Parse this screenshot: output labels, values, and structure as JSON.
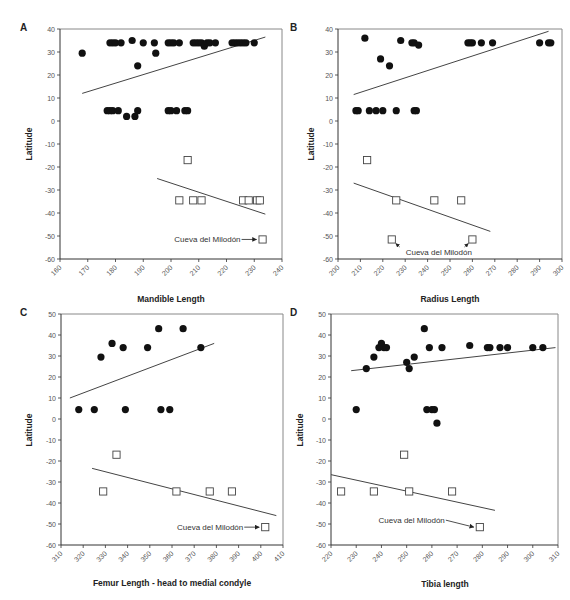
{
  "chart_data": [
    {
      "panel": "A",
      "type": "scatter",
      "xlabel": "Mandible Length",
      "ylabel": "Latitude",
      "xlim": [
        160,
        240
      ],
      "ylim": [
        -60,
        40
      ],
      "xticks": [
        160,
        170,
        180,
        190,
        200,
        210,
        220,
        230,
        240
      ],
      "yticks": [
        40,
        30,
        20,
        10,
        0,
        -10,
        -20,
        -30,
        -40,
        -50,
        -60
      ],
      "series": [
        {
          "name": "North (filled circles)",
          "marker": "circle",
          "points": [
            [
              168,
              29.5
            ],
            [
              178,
              34
            ],
            [
              179,
              34
            ],
            [
              180,
              34
            ],
            [
              182,
              34
            ],
            [
              186,
              35
            ],
            [
              188,
              24
            ],
            [
              190,
              34
            ],
            [
              194,
              34
            ],
            [
              194.5,
              29.5
            ],
            [
              199,
              34
            ],
            [
              200,
              34
            ],
            [
              201,
              34
            ],
            [
              203,
              34
            ],
            [
              208,
              34
            ],
            [
              209,
              34
            ],
            [
              210,
              34
            ],
            [
              211,
              34
            ],
            [
              212,
              32.5
            ],
            [
              213,
              34
            ],
            [
              214,
              34
            ],
            [
              216,
              34
            ],
            [
              222,
              34
            ],
            [
              223,
              34
            ],
            [
              224,
              34
            ],
            [
              225,
              34
            ],
            [
              226,
              34
            ],
            [
              227,
              34
            ],
            [
              230,
              34
            ],
            [
              177,
              4.5
            ],
            [
              178,
              4.5
            ],
            [
              179,
              4.5
            ],
            [
              181,
              4.5
            ],
            [
              184,
              2
            ],
            [
              187,
              2
            ],
            [
              188,
              4.5
            ],
            [
              199,
              4.5
            ],
            [
              200,
              4.5
            ],
            [
              202,
              4.5
            ],
            [
              205,
              4.5
            ],
            [
              206,
              4.5
            ]
          ]
        },
        {
          "name": "South (open squares)",
          "marker": "square",
          "points": [
            [
              206,
              -17
            ],
            [
              203,
              -34.5
            ],
            [
              208,
              -34.5
            ],
            [
              211,
              -34.5
            ],
            [
              226,
              -34.5
            ],
            [
              228,
              -34.5
            ],
            [
              231,
              -34.5
            ],
            [
              232,
              -34.5
            ],
            [
              233,
              -51.5
            ]
          ]
        }
      ],
      "trendlines": [
        {
          "series": "North",
          "from": [
            168,
            12
          ],
          "to": [
            234,
            36.5
          ]
        },
        {
          "series": "South",
          "from": [
            195,
            -25
          ],
          "to": [
            234,
            -40.5
          ]
        }
      ],
      "annotations": [
        {
          "text": "Cueva del Milodón",
          "target": [
            233,
            -51.5
          ]
        }
      ]
    },
    {
      "panel": "B",
      "type": "scatter",
      "xlabel": "Radius Length",
      "ylabel": "Latitude",
      "xlim": [
        200,
        300
      ],
      "ylim": [
        -60,
        40
      ],
      "xticks": [
        200,
        210,
        220,
        230,
        240,
        250,
        260,
        270,
        280,
        290,
        300
      ],
      "yticks": [
        40,
        30,
        20,
        10,
        0,
        -10,
        -20,
        -30,
        -40,
        -50,
        -60
      ],
      "series": [
        {
          "name": "North (filled circles)",
          "marker": "circle",
          "points": [
            [
              208,
              4.5
            ],
            [
              209,
              4.5
            ],
            [
              212,
              36
            ],
            [
              214,
              4.5
            ],
            [
              217,
              4.5
            ],
            [
              219,
              27
            ],
            [
              220,
              4.5
            ],
            [
              223,
              24
            ],
            [
              226,
              4.5
            ],
            [
              228,
              35
            ],
            [
              233,
              34
            ],
            [
              234,
              34
            ],
            [
              234,
              4.5
            ],
            [
              235,
              4.5
            ],
            [
              236,
              33
            ],
            [
              258,
              34
            ],
            [
              259,
              34
            ],
            [
              260,
              34
            ],
            [
              264,
              34
            ],
            [
              269,
              34
            ],
            [
              290,
              34
            ],
            [
              294,
              34
            ],
            [
              295,
              34
            ]
          ]
        },
        {
          "name": "South (open squares)",
          "marker": "square",
          "points": [
            [
              213,
              -17
            ],
            [
              226,
              -34.5
            ],
            [
              243,
              -34.5
            ],
            [
              255,
              -34.5
            ],
            [
              224,
              -51.5
            ],
            [
              260,
              -51.5
            ]
          ]
        }
      ],
      "trendlines": [
        {
          "series": "North",
          "from": [
            207,
            11.5
          ],
          "to": [
            294,
            39
          ]
        },
        {
          "series": "South",
          "from": [
            207,
            -27
          ],
          "to": [
            268,
            -48
          ]
        }
      ],
      "annotations": [
        {
          "text": "Cueva del Milodón",
          "target": [
            [
              224,
              -51.5
            ],
            [
              260,
              -51.5
            ]
          ]
        }
      ]
    },
    {
      "panel": "C",
      "type": "scatter",
      "xlabel": "Femur Length - head to medial condyle",
      "ylabel": "Latitude",
      "xlim": [
        310,
        410
      ],
      "ylim": [
        -60,
        50
      ],
      "xticks": [
        310,
        320,
        330,
        340,
        350,
        360,
        370,
        380,
        390,
        400,
        410
      ],
      "yticks": [
        50,
        40,
        30,
        20,
        10,
        0,
        -10,
        -20,
        -30,
        -40,
        -50,
        -60
      ],
      "series": [
        {
          "name": "North (filled circles)",
          "marker": "circle",
          "points": [
            [
              318,
              4.5
            ],
            [
              325,
              4.5
            ],
            [
              328,
              29.5
            ],
            [
              333,
              36
            ],
            [
              338,
              34
            ],
            [
              339,
              4.5
            ],
            [
              349,
              34
            ],
            [
              354,
              43
            ],
            [
              355,
              4.5
            ],
            [
              359,
              4.5
            ],
            [
              365,
              43
            ],
            [
              373,
              34
            ]
          ]
        },
        {
          "name": "South (open squares)",
          "marker": "square",
          "points": [
            [
              335,
              -17
            ],
            [
              329,
              -34.5
            ],
            [
              362,
              -34.5
            ],
            [
              377,
              -34.5
            ],
            [
              387,
              -34.5
            ],
            [
              402,
              -51.5
            ]
          ]
        }
      ],
      "trendlines": [
        {
          "series": "North",
          "from": [
            314,
            10
          ],
          "to": [
            379,
            36
          ]
        },
        {
          "series": "South",
          "from": [
            324,
            -23.5
          ],
          "to": [
            407,
            -46
          ]
        }
      ],
      "annotations": [
        {
          "text": "Cueva del Milodón",
          "target": [
            402,
            -51.5
          ]
        }
      ]
    },
    {
      "panel": "D",
      "type": "scatter",
      "xlabel": "Tibia length",
      "ylabel": "Latitude",
      "xlim": [
        220,
        310
      ],
      "ylim": [
        -60,
        50
      ],
      "xticks": [
        220,
        230,
        240,
        250,
        260,
        270,
        280,
        290,
        300,
        310
      ],
      "yticks": [
        50,
        40,
        30,
        20,
        10,
        0,
        -10,
        -20,
        -30,
        -40,
        -50,
        -60
      ],
      "series": [
        {
          "name": "North (filled circles)",
          "marker": "circle",
          "points": [
            [
              230,
              4.5
            ],
            [
              234,
              24
            ],
            [
              237,
              29.5
            ],
            [
              239,
              34
            ],
            [
              240,
              36
            ],
            [
              241,
              34
            ],
            [
              242,
              34
            ],
            [
              250,
              27
            ],
            [
              251,
              24
            ],
            [
              253,
              29.5
            ],
            [
              257,
              43
            ],
            [
              258,
              4.5
            ],
            [
              259,
              34
            ],
            [
              260,
              4.5
            ],
            [
              261,
              4.5
            ],
            [
              262,
              -2
            ],
            [
              264,
              34
            ],
            [
              275,
              35
            ],
            [
              282,
              34
            ],
            [
              283,
              34
            ],
            [
              287,
              34
            ],
            [
              290,
              34
            ],
            [
              300,
              34
            ],
            [
              304,
              34
            ]
          ]
        },
        {
          "name": "South (open squares)",
          "marker": "square",
          "points": [
            [
              249,
              -17
            ],
            [
              224,
              -34.5
            ],
            [
              237,
              -34.5
            ],
            [
              251,
              -34.5
            ],
            [
              268,
              -34.5
            ],
            [
              279,
              -51.5
            ]
          ]
        }
      ],
      "trendlines": [
        {
          "series": "North",
          "from": [
            228,
            23
          ],
          "to": [
            309,
            34
          ]
        },
        {
          "series": "South",
          "from": [
            220,
            -26.5
          ],
          "to": [
            285,
            -43.5
          ]
        }
      ],
      "annotations": [
        {
          "text": "Cueva del Milodón",
          "target": [
            279,
            -51.5
          ]
        }
      ]
    }
  ],
  "panels": [
    {
      "label": "A",
      "xlabel": "Mandible Length",
      "ylabel": "Latitude",
      "annotation": "Cueva del Milodón"
    },
    {
      "label": "B",
      "xlabel": "Radius Length",
      "ylabel": "Latitude",
      "annotation": "Cueva del Milodón"
    },
    {
      "label": "C",
      "xlabel": "Femur Length - head to medial condyle",
      "ylabel": "Latitude",
      "annotation": "Cueva del Milodón"
    },
    {
      "label": "D",
      "xlabel": "Tibia length",
      "ylabel": "Latitude",
      "annotation": "Cueva del Milodón"
    }
  ]
}
